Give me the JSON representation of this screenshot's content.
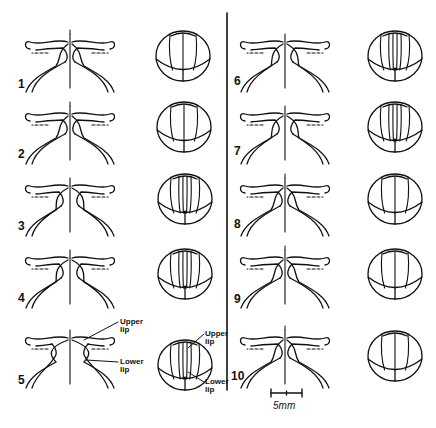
{
  "figure": {
    "columns": [
      {
        "id": "left",
        "rows": [
          {
            "label": "1",
            "label_xy": [
              18,
              78
            ],
            "mouth_center": [
              70,
              52
            ],
            "sphere_center": [
              183,
              56
            ],
            "variant": "open-flared"
          },
          {
            "label": "2",
            "label_xy": [
              18,
              148
            ],
            "mouth_center": [
              70,
              124
            ],
            "sphere_center": [
              184,
              127
            ],
            "variant": "open-flared"
          },
          {
            "label": "3",
            "label_xy": [
              18,
              220
            ],
            "mouth_center": [
              70,
              196
            ],
            "sphere_center": [
              185,
              199
            ],
            "variant": "narrowing"
          },
          {
            "label": "4",
            "label_xy": [
              18,
              292
            ],
            "mouth_center": [
              70,
              268
            ],
            "sphere_center": [
              185,
              274
            ],
            "variant": "narrowing"
          },
          {
            "label": "5",
            "label_xy": [
              18,
              374
            ],
            "mouth_center": [
              70,
              348
            ],
            "sphere_center": [
              185,
              365
            ],
            "variant": "annotated"
          }
        ]
      },
      {
        "id": "right",
        "rows": [
          {
            "label": "6",
            "label_xy": [
              234,
              75
            ],
            "mouth_center": [
              285,
              52
            ],
            "sphere_center": [
              395,
              56
            ],
            "variant": "closed"
          },
          {
            "label": "7",
            "label_xy": [
              234,
              145
            ],
            "mouth_center": [
              285,
              124
            ],
            "sphere_center": [
              395,
              127
            ],
            "variant": "closed"
          },
          {
            "label": "8",
            "label_xy": [
              234,
              218
            ],
            "mouth_center": [
              285,
              196
            ],
            "sphere_center": [
              395,
              199
            ],
            "variant": "open-flared"
          },
          {
            "label": "9",
            "label_xy": [
              234,
              293
            ],
            "mouth_center": [
              285,
              268
            ],
            "sphere_center": [
              395,
              274
            ],
            "variant": "open-flared"
          },
          {
            "label": "10",
            "label_xy": [
              231,
              370
            ],
            "mouth_center": [
              285,
              348
            ],
            "sphere_center": [
              395,
              356
            ],
            "variant": "open-flared"
          }
        ]
      }
    ],
    "annotations": {
      "mouth_upper": {
        "text1": "Upper",
        "text2": "lip",
        "xy": [
          120,
          318
        ]
      },
      "mouth_lower": {
        "text1": "Lower",
        "text2": "lip",
        "xy": [
          120,
          358
        ]
      },
      "sphere_upper": {
        "text1": "Upper",
        "text2": "lip",
        "xy": [
          205,
          330
        ]
      },
      "sphere_lower": {
        "text1": "Lower",
        "text2": "lip",
        "xy": [
          205,
          378
        ]
      }
    },
    "scale_bar": {
      "label": "5mm",
      "x1": 271,
      "x2": 302,
      "y": 393,
      "label_xy": [
        273,
        400
      ]
    },
    "divider": {
      "x": 227,
      "y1": 13,
      "y2": 390
    },
    "colors": {
      "ink": "#111111",
      "background": "#ffffff"
    }
  }
}
